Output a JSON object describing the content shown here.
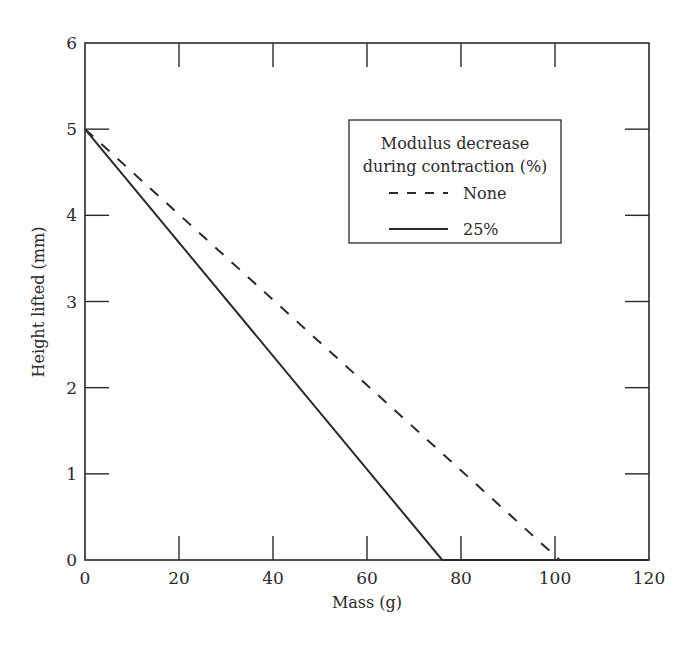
{
  "chart_data": {
    "type": "line",
    "title": "",
    "xlabel": "Mass (g)",
    "ylabel": "Height lifted (mm)",
    "xlim": [
      0,
      120
    ],
    "ylim": [
      0,
      6
    ],
    "xticks": [
      0,
      20,
      40,
      60,
      80,
      100,
      120
    ],
    "yticks": [
      0,
      1,
      2,
      3,
      4,
      5,
      6
    ],
    "grid": false,
    "legend": {
      "title_line1": "Modulus decrease",
      "title_line2": "during contraction (%)",
      "position": "upper right (inside)",
      "entries": [
        {
          "label": "None",
          "style": "dashed"
        },
        {
          "label": "25%",
          "style": "solid"
        }
      ]
    },
    "series": [
      {
        "name": "None",
        "style": "dashed",
        "x": [
          0,
          101,
          120
        ],
        "y": [
          5,
          0,
          0
        ]
      },
      {
        "name": "25%",
        "style": "solid",
        "x": [
          0,
          76,
          120
        ],
        "y": [
          5,
          0,
          0
        ]
      }
    ],
    "colors": {
      "line": "#2a2a2a",
      "background": "#ffffff"
    }
  }
}
